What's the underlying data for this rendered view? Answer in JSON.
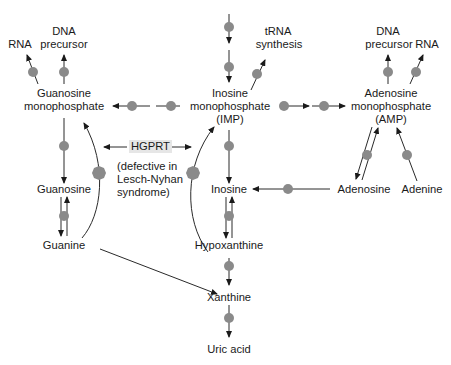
{
  "colors": {
    "enzyme_dot": "#8a8a8a",
    "line": "#2a2a2a",
    "hgprt_bg": "#e6e6e6"
  },
  "nodes": {
    "gmp_line1": "Guanosine",
    "gmp_line2": "monophosphate",
    "imp_line1": "Inosine",
    "imp_line2": "monophosphate",
    "imp_line3": "(IMP)",
    "amp_line1": "Adenosine",
    "amp_line2": "monophosphate",
    "amp_line3": "(AMP)",
    "guanosine": "Guanosine",
    "guanine": "Guanine",
    "inosine": "Inosine",
    "hypoxanthine": "Hypoxanthine",
    "adenosine": "Adenosine",
    "adenine": "Adenine",
    "xanthine": "Xanthine",
    "uric_acid": "Uric acid"
  },
  "products": {
    "rna_left": "RNA",
    "dna_left_1": "DNA",
    "dna_left_2": "precursor",
    "trna_1": "tRNA",
    "trna_2": "synthesis",
    "dna_right_1": "DNA",
    "dna_right_2": "precursor",
    "rna_right": "RNA"
  },
  "enzyme": {
    "label": "HGPRT",
    "note_line1": "(defective in",
    "note_line2": "Lesch-Nyhan",
    "note_line3": "syndrome)"
  }
}
